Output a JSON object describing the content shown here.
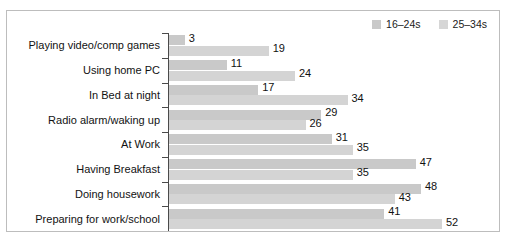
{
  "chart_data": {
    "type": "bar",
    "orientation": "horizontal",
    "title": "",
    "xlabel": "",
    "ylabel": "",
    "grid": false,
    "legend_position": "top-right",
    "xlim": [
      0,
      52
    ],
    "categories": [
      "Playing video/comp games",
      "Using home PC",
      "In Bed at night",
      "Radio alarm/waking up",
      "At Work",
      "Having Breakfast",
      "Doing housework",
      "Preparing for work/school"
    ],
    "series": [
      {
        "name": "16–24s",
        "color": "#c9c9c9",
        "values": [
          3,
          11,
          17,
          29,
          31,
          47,
          48,
          41
        ]
      },
      {
        "name": "25–34s",
        "color": "#d4d4d4",
        "values": [
          19,
          24,
          34,
          26,
          35,
          35,
          43,
          52
        ]
      }
    ]
  },
  "legend": {
    "items": [
      {
        "label": "16–24s",
        "color": "#c9c9c9"
      },
      {
        "label": "25–34s",
        "color": "#d6d6d6"
      }
    ]
  },
  "colors": {
    "series_1": "#c9c9c9",
    "series_2": "#d4d4d4",
    "axis": "#4a4a4a",
    "border": "#bdbdbd",
    "text": "#121212"
  }
}
